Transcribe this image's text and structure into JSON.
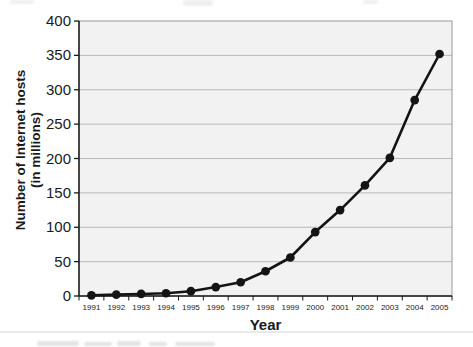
{
  "page": {
    "background_color": "#ffffff",
    "divider_color": "#eaeaea"
  },
  "chart_data": {
    "type": "line",
    "title": "",
    "categories": [
      "1991",
      "1992",
      "1993",
      "1994",
      "1995",
      "1996",
      "1997",
      "1998",
      "1999",
      "2000",
      "2001",
      "2002",
      "2003",
      "2004",
      "2005"
    ],
    "series": [
      {
        "name": "Number of Internet hosts",
        "values": [
          1,
          2,
          3,
          4,
          7,
          13,
          20,
          36,
          56,
          93,
          125,
          161,
          201,
          285,
          352
        ]
      }
    ],
    "xlabel": "Year",
    "ylabel_lines": [
      "Number of Internet hosts",
      "(in millions)"
    ],
    "ylim": [
      0,
      400
    ],
    "yticks": [
      0,
      50,
      100,
      150,
      200,
      250,
      300,
      350,
      400
    ],
    "grid": "horizontal",
    "legend_position": "none",
    "marker": "filled-circle",
    "colors": {
      "line": "#141414",
      "marker": "#141414",
      "plot_fill": "#f2f2f2",
      "grid": "#b9b9b9",
      "plot_border": "#999999",
      "axis": "#1a1a1a",
      "text": "#1a1a1a"
    }
  }
}
